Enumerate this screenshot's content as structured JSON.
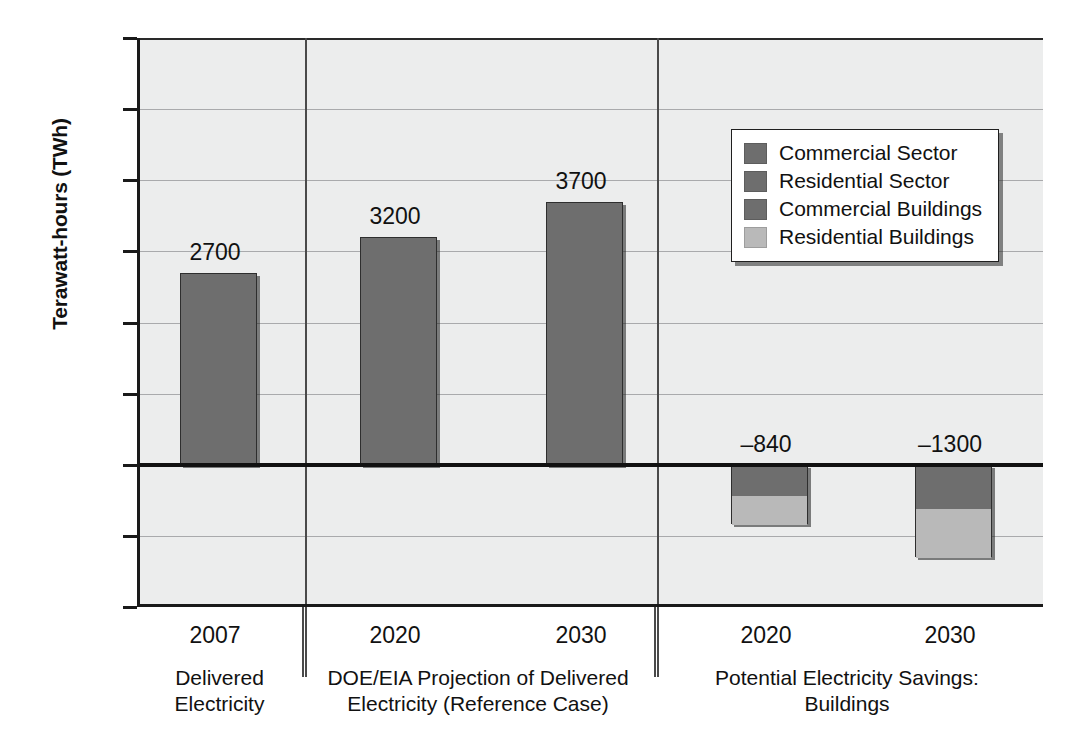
{
  "chart_data": {
    "type": "bar",
    "title": "",
    "subtitle": "",
    "xlabel": "",
    "ylabel": "Terawatt-hours (TWh)",
    "ylim": [
      -2000,
      6000
    ],
    "ytick_step": 1000,
    "yticks": [
      "6000",
      "5000",
      "4000",
      "3000",
      "2000",
      "1000",
      "0",
      "–1000",
      "–2000"
    ],
    "grid": true,
    "legend_position": "upper-right",
    "legend": [
      {
        "name": "Commercial Sector",
        "color": "#6e6e6e"
      },
      {
        "name": "Residential Sector",
        "color": "#6e6e6e"
      },
      {
        "name": "Commercial Buildings",
        "color": "#6e6e6e"
      },
      {
        "name": "Residential Buildings",
        "color": "#b9b9b9"
      }
    ],
    "groups": [
      {
        "caption": "Delivered\nElectricity",
        "caption_line1": "Delivered",
        "caption_line2": "Electricity",
        "bars": [
          {
            "x": "2007",
            "total": 2700,
            "label": "2700",
            "segments": [
              {
                "series": "Commercial Sector",
                "value": 1350,
                "color": "#6e6e6e"
              },
              {
                "series": "Residential Sector",
                "value": 1350,
                "color": "#6e6e6e"
              }
            ]
          }
        ]
      },
      {
        "caption": "DOE/EIA Projection of Delivered\nElectricity (Reference Case)",
        "caption_line1": "DOE/EIA Projection of Delivered",
        "caption_line2": "Electricity (Reference Case)",
        "bars": [
          {
            "x": "2020",
            "total": 3200,
            "label": "3200",
            "segments": [
              {
                "series": "Commercial Sector",
                "value": 1600,
                "color": "#6e6e6e"
              },
              {
                "series": "Residential Sector",
                "value": 1600,
                "color": "#6e6e6e"
              }
            ]
          },
          {
            "x": "2030",
            "total": 3700,
            "label": "3700",
            "segments": [
              {
                "series": "Commercial Sector",
                "value": 1850,
                "color": "#6e6e6e"
              },
              {
                "series": "Residential Sector",
                "value": 1850,
                "color": "#6e6e6e"
              }
            ]
          }
        ]
      },
      {
        "caption": "Potential Electricity Savings:\nBuildings",
        "caption_line1": "Potential Electricity Savings:",
        "caption_line2": "Buildings",
        "bars": [
          {
            "x": "2020",
            "total": -840,
            "label": "–840",
            "segments": [
              {
                "series": "Commercial Buildings",
                "value": -430,
                "color": "#6e6e6e"
              },
              {
                "series": "Residential Buildings",
                "value": -410,
                "color": "#b9b9b9"
              }
            ]
          },
          {
            "x": "2030",
            "total": -1300,
            "label": "–1300",
            "segments": [
              {
                "series": "Commercial Buildings",
                "value": -610,
                "color": "#6e6e6e"
              },
              {
                "series": "Residential Buildings",
                "value": -690,
                "color": "#b9b9b9"
              }
            ]
          }
        ]
      }
    ]
  },
  "colors": {
    "plot_background": "#eceded",
    "gridline": "#a9aaac",
    "axis": "#111111",
    "bar_dark": "#6e6e6e",
    "bar_light": "#b9b9b9"
  }
}
